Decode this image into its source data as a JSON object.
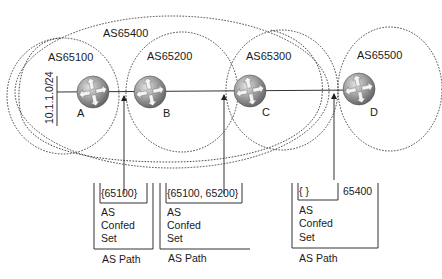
{
  "diagram": {
    "confederation": {
      "label": "AS65400"
    },
    "sub_as": [
      {
        "id": "as65100",
        "label": "AS65100"
      },
      {
        "id": "as65200",
        "label": "AS65200"
      },
      {
        "id": "as65300",
        "label": "AS65300"
      },
      {
        "id": "as65500",
        "label": "AS65500"
      }
    ],
    "routers": [
      {
        "id": "A",
        "label": "A",
        "icon": "router-icon"
      },
      {
        "id": "B",
        "label": "B",
        "icon": "router-icon"
      },
      {
        "id": "C",
        "label": "C",
        "icon": "router-icon"
      },
      {
        "id": "D",
        "label": "D",
        "icon": "router-icon"
      }
    ],
    "network": {
      "label": "10.1.1.0/24"
    },
    "as_paths": [
      {
        "confed_set": "{65100}",
        "as_sequence": "",
        "confed_label": [
          "AS",
          "Confed",
          "Set"
        ],
        "path_label": "AS Path"
      },
      {
        "confed_set": "{65100, 65200}",
        "as_sequence": "",
        "confed_label": [
          "AS",
          "Confed",
          "Set"
        ],
        "path_label": "AS Path"
      },
      {
        "confed_set": "{ }",
        "as_sequence": "65400",
        "confed_label": [
          "AS",
          "Confed",
          "Set"
        ],
        "path_label": "AS Path"
      }
    ]
  },
  "colors": {
    "line": "#333333",
    "router_fill": "#8a8a8a",
    "router_highlight": "#d0d0d0",
    "text": "#1a1a1a"
  }
}
